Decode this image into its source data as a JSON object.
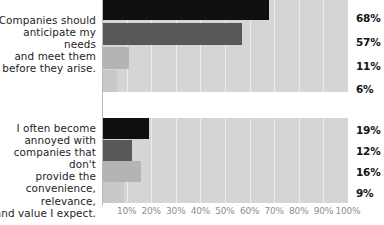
{
  "chart_data": {
    "type": "bar",
    "orientation": "horizontal",
    "title": "",
    "xlabel": "",
    "ylabel": "",
    "xlim": [
      0,
      100
    ],
    "grid": true,
    "legend_position": "none",
    "tick_labels": [
      "10%",
      "20%",
      "30%",
      "40%",
      "50%",
      "60%",
      "70%",
      "80%",
      "90%",
      "100%"
    ],
    "tick_values": [
      10,
      20,
      30,
      40,
      50,
      60,
      70,
      80,
      90,
      100
    ],
    "track_color": "#d5d5d5",
    "series_colors": [
      "#100f0f",
      "#585858",
      "#b4b4b4",
      "#c9c9c9"
    ],
    "groups": [
      {
        "label": "Companies should\nanticipate my needs\nand meet them\nbefore they arise.",
        "bars": [
          {
            "value": 68,
            "value_label": "68%",
            "color": "#100f0f"
          },
          {
            "value": 57,
            "value_label": "57%",
            "color": "#585858"
          },
          {
            "value": 11,
            "value_label": "11%",
            "color": "#b4b4b4"
          },
          {
            "value": 6,
            "value_label": "6%",
            "color": "#c9c9c9"
          }
        ]
      },
      {
        "label": "I often become\nannoyed with\ncompanies that don't\nprovide the\nconvenience,\nrelevance,\nand value I expect.",
        "bars": [
          {
            "value": 19,
            "value_label": "19%",
            "color": "#100f0f"
          },
          {
            "value": 12,
            "value_label": "12%",
            "color": "#585858"
          },
          {
            "value": 16,
            "value_label": "16%",
            "color": "#b4b4b4"
          },
          {
            "value": 9,
            "value_label": "9%",
            "color": "#c9c9c9"
          }
        ]
      }
    ]
  }
}
